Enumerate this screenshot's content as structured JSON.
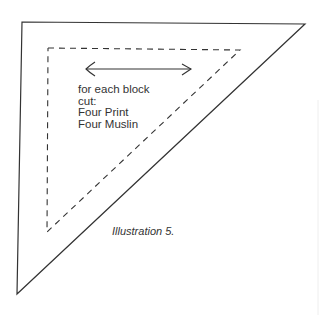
{
  "diagram": {
    "type": "quilt-template-triangle",
    "instructions": {
      "line1": "for each block",
      "line2": "cut:",
      "line3": "Four Print",
      "line4": "Four Muslin"
    },
    "caption": "Illustration 5.",
    "elements": [
      "outer-cutting-line",
      "dashed-seam-line",
      "grain-arrow"
    ],
    "colors": {
      "line": "#333333",
      "background": "#ffffff"
    }
  }
}
